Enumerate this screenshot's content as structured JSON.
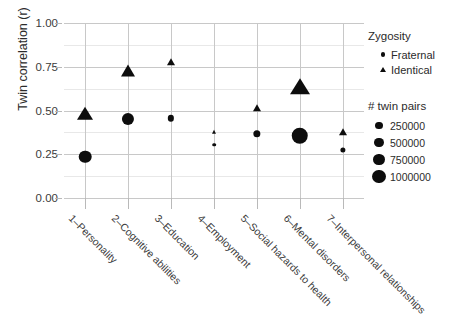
{
  "chart_data": {
    "type": "scatter",
    "title": "",
    "xlabel": "",
    "ylabel": "Twin correlation (r)",
    "ylim": [
      0.0,
      1.0
    ],
    "ytick_labels": [
      "0.00",
      "0.25",
      "0.50",
      "0.75",
      "1.00"
    ],
    "ytick_values": [
      0.0,
      0.25,
      0.5,
      0.75,
      1.0
    ],
    "grid": true,
    "legend_position": "right",
    "categories": [
      "1–Personality",
      "2–Cognitive abilities",
      "3–Education",
      "4–Employment",
      "5–Social hazards to health",
      "6–Mental disorders",
      "7–Interpersonal relationships"
    ],
    "series": [
      {
        "name": "Fraternal",
        "marker": "circle",
        "values": [
          0.235,
          0.45,
          0.455,
          0.305,
          0.365,
          0.355,
          0.275
        ],
        "sizes": [
          620000,
          580000,
          200000,
          90000,
          250000,
          1000000,
          150000
        ]
      },
      {
        "name": "Identical",
        "marker": "triangle",
        "values": [
          0.48,
          0.725,
          0.78,
          0.375,
          0.515,
          0.635,
          0.375
        ],
        "sizes": [
          700000,
          560000,
          230000,
          130000,
          230000,
          1000000,
          230000
        ]
      }
    ]
  },
  "legend": {
    "zygosity": {
      "title": "Zygosity",
      "items": [
        {
          "label": "Fraternal",
          "marker": "circle"
        },
        {
          "label": "Identical",
          "marker": "triangle"
        }
      ]
    },
    "size": {
      "title": "# twin pairs",
      "items": [
        {
          "label": "250000",
          "value": 250000
        },
        {
          "label": "500000",
          "value": 500000
        },
        {
          "label": "750000",
          "value": 750000
        },
        {
          "label": "1000000",
          "value": 1000000
        }
      ]
    }
  },
  "colors": {
    "marker": "#0d0d0d",
    "grid_major": "#c8c8c8",
    "grid_minor": "#e8e8e8",
    "text": "#2b2b2b",
    "background": "#ffffff"
  }
}
